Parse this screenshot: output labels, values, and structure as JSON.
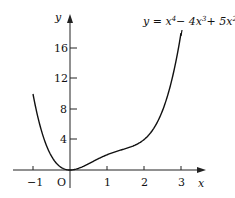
{
  "chart_data": {
    "type": "line",
    "equation": {
      "prefix": "y = x",
      "e1": "4",
      "mid1": "− 4x",
      "e2": "3",
      "mid2": "+ 5x",
      "e3": "2"
    },
    "xlabel": "x",
    "ylabel": "y",
    "origin_label": "O",
    "xlim": [
      -1.3,
      3.6
    ],
    "ylim": [
      -1.5,
      20
    ],
    "x_ticks": [
      -1,
      1,
      2,
      3
    ],
    "x_tick_labels": [
      "−1",
      "1",
      "2",
      "3"
    ],
    "y_ticks": [
      4,
      8,
      12,
      16
    ],
    "y_tick_labels": [
      "4",
      "8",
      "12",
      "16"
    ],
    "grid": false,
    "series": [
      {
        "name": "y = x^4 - 4x^3 + 5x^2",
        "domain": [
          -1,
          3
        ],
        "x": [
          -1,
          -0.5,
          0,
          0.5,
          1,
          1.5,
          2,
          2.5,
          3
        ],
        "values": [
          10,
          1.81,
          0,
          0.81,
          2,
          2.81,
          4,
          7.81,
          18
        ]
      }
    ]
  }
}
